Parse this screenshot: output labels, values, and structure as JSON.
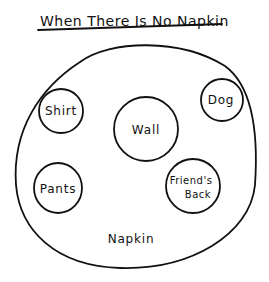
{
  "title": "When There Is No Napkin",
  "outer": {
    "label": "Napkin"
  },
  "items": [
    {
      "id": "shirt",
      "label": "Shirt"
    },
    {
      "id": "wall",
      "label": "Wall"
    },
    {
      "id": "dog",
      "label": "Dog"
    },
    {
      "id": "pants",
      "label": "Pants"
    },
    {
      "id": "friends-back",
      "label_line1": "Friend's",
      "label_line2": "Back"
    }
  ]
}
